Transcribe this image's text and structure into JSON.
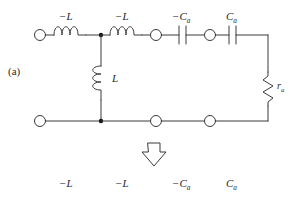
{
  "figure": {
    "panel_label": "(a)",
    "arrow": "down-arrow"
  },
  "top_labels": [
    {
      "id": "l1",
      "text": "−L"
    },
    {
      "id": "l2",
      "text": "−L"
    },
    {
      "id": "c1",
      "base": "−C",
      "sub": "a"
    },
    {
      "id": "c2",
      "base": "C",
      "sub": "a"
    }
  ],
  "bottom_labels": [
    {
      "id": "b1",
      "text": "−L"
    },
    {
      "id": "b2",
      "text": "−L"
    },
    {
      "id": "b3",
      "base": "−C",
      "sub": "a"
    },
    {
      "id": "b4",
      "base": "C",
      "sub": "a"
    }
  ],
  "components": {
    "shunt_inductor_label": "L",
    "resistor_base": "r",
    "resistor_sub": "a"
  },
  "colors": {
    "wire": "#3a3a3a",
    "text": "#2a2a2a",
    "background": "#ffffff",
    "node_fill": "#ffffff",
    "junction_fill": "#111111"
  }
}
